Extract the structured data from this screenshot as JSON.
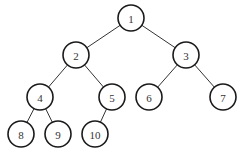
{
  "diagram": {
    "type": "binary-tree",
    "nodes": [
      {
        "id": "1",
        "label": "1",
        "x": 131,
        "y": 18
      },
      {
        "id": "2",
        "label": "2",
        "x": 76,
        "y": 55
      },
      {
        "id": "3",
        "label": "3",
        "x": 186,
        "y": 55
      },
      {
        "id": "4",
        "label": "4",
        "x": 40,
        "y": 97
      },
      {
        "id": "5",
        "label": "5",
        "x": 112,
        "y": 97
      },
      {
        "id": "6",
        "label": "6",
        "x": 149,
        "y": 97
      },
      {
        "id": "7",
        "label": "7",
        "x": 223,
        "y": 97
      },
      {
        "id": "8",
        "label": "8",
        "x": 21,
        "y": 134
      },
      {
        "id": "9",
        "label": "9",
        "x": 58,
        "y": 134
      },
      {
        "id": "10",
        "label": "10",
        "x": 95,
        "y": 134
      }
    ],
    "edges": [
      [
        "1",
        "2"
      ],
      [
        "1",
        "3"
      ],
      [
        "2",
        "4"
      ],
      [
        "2",
        "5"
      ],
      [
        "3",
        "6"
      ],
      [
        "3",
        "7"
      ],
      [
        "4",
        "8"
      ],
      [
        "4",
        "9"
      ],
      [
        "5",
        "10"
      ]
    ],
    "node_radius": 13
  }
}
